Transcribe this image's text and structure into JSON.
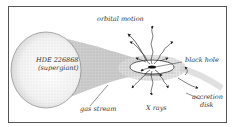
{
  "diagram": {
    "star_label_line1": "HDE 226868",
    "star_label_line2": "(supergiant)",
    "labels": {
      "orbital_motion": "orbital motion",
      "black_hole": "black hole",
      "gas_stream": "gas stream",
      "x_rays": "X rays",
      "accretion_disk_line1": "accretion",
      "accretion_disk_line2": "disk"
    }
  }
}
